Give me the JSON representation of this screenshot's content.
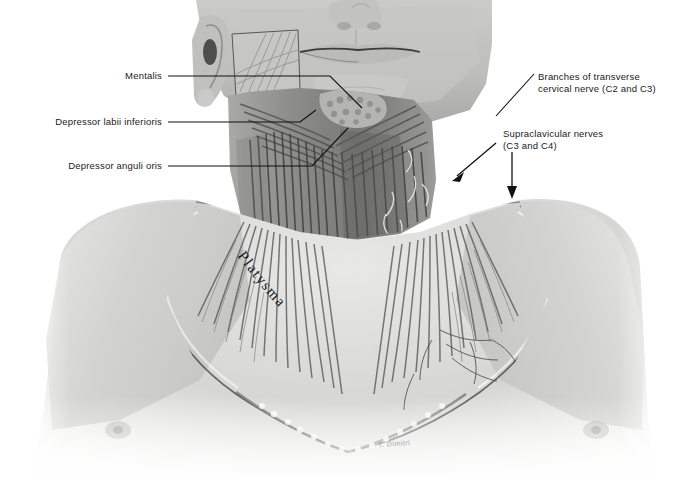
{
  "figure": {
    "kind": "anatomical-illustration",
    "style": "grayscale pencil/wash medical illustration",
    "background_color": "#ffffff",
    "ink_color": "#111111"
  },
  "labels": {
    "mentalis": "Mentalis",
    "depressor_labii_inferioris": "Depressor labii inferioris",
    "depressor_anguli_oris": "Depressor anguli oris",
    "transverse_cervical": "Branches of transverse\ncervical nerve (C2 and C3)",
    "supraclavicular": "Supraclavicular nerves\n(C3 and C4)",
    "platysma": "Platysma",
    "signature": "T. Dimitri"
  },
  "annotations": {
    "arrow_transverse_cervical": "arrow pointing down-left to nerve branches on neck",
    "arrow_supraclavicular": "arrow pointing down to supraclavicular nerves at clavicle"
  }
}
